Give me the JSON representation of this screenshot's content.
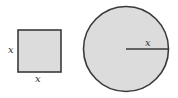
{
  "diagram": {
    "colors": {
      "fill": "#dcdcdc",
      "stroke": "#3a3a3a"
    },
    "square": {
      "side_label_left": "x",
      "side_label_bottom": "x"
    },
    "circle": {
      "radius_label": "x"
    }
  }
}
